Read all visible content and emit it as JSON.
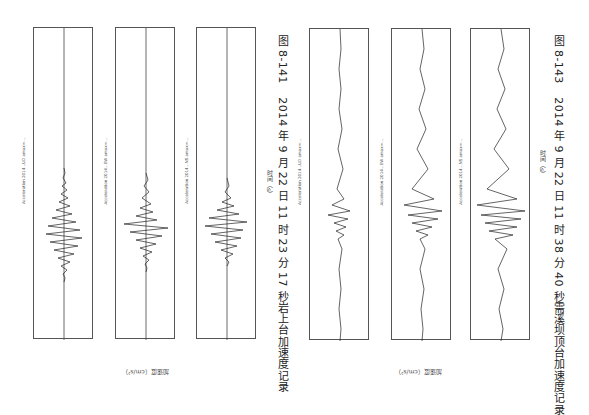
{
  "page": {
    "orientation": "rotated-90",
    "background": "#ffffff"
  },
  "figures": [
    {
      "id": "fig-8-141",
      "caption_number": "图 8-141",
      "caption_text": "2014 年 9 月 22 日 11 时 23 分 17 秒岩上台加速度记录",
      "y_axis_label": "加速度（cm/s²）",
      "x_axis_label": "时间（s）",
      "time_ticks": [
        "0",
        "2",
        "4",
        "6",
        "8",
        "10",
        "12",
        "14",
        "16",
        "18",
        "20",
        "22",
        "24",
        "26",
        "28",
        "30",
        "32",
        "34",
        "36",
        "38",
        "40"
      ],
      "plots": [
        {
          "component": "UD",
          "title": "Acceleration 2014…UD amax=…"
        },
        {
          "component": "EW",
          "title": "Acceleration 2014…EW amax=…"
        },
        {
          "component": "NS",
          "title": "Acceleration 2014…NS amax=…"
        }
      ]
    },
    {
      "id": "fig-8-143",
      "caption_number": "图 8-143",
      "caption_text": "2014 年 9 月 22 日 11 时 38 分 40 秒需溪坝顶台加速度记录",
      "y_axis_label": "加速度（cm/s²）",
      "x_axis_label": "时间（s）",
      "time_ticks": [
        "0",
        "2",
        "4",
        "6",
        "8",
        "10",
        "12",
        "14",
        "16",
        "18",
        "20",
        "22",
        "24",
        "26",
        "28",
        "30",
        "32",
        "34",
        "36",
        "38",
        "40"
      ],
      "plots": [
        {
          "component": "UD",
          "title": "Acceleration 2014…UD amax=…"
        },
        {
          "component": "EW",
          "title": "Acceleration 2014…EW amax=…"
        },
        {
          "component": "NS",
          "title": "Acceleration 2014…NS amax=…"
        }
      ]
    }
  ],
  "amp_ticks": [
    "-5",
    "-4",
    "-3",
    "-2",
    "-1",
    "0",
    "1",
    "2",
    "3",
    "4",
    "5"
  ]
}
